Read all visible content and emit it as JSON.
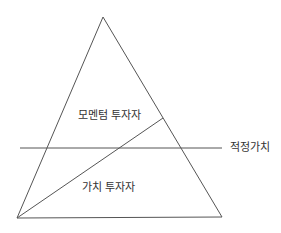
{
  "diagram": {
    "labels": {
      "momentum": "모멘텀 투자자",
      "value": "가치 투자자",
      "fair_value": "적정가치"
    },
    "colors": {
      "line": "#555555",
      "text": "#333333",
      "background": "#ffffff"
    },
    "shapes": {
      "triangle": {
        "apex": [
          103,
          17
        ],
        "bottom_left": [
          17,
          218
        ],
        "bottom_right": [
          222,
          217
        ]
      },
      "diagonal": {
        "from": [
          17,
          218
        ],
        "to": [
          163,
          118
        ]
      },
      "fair_value_line": {
        "from": [
          20,
          148
        ],
        "to": [
          222,
          148
        ]
      }
    }
  }
}
